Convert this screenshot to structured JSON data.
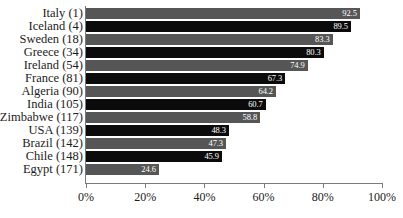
{
  "chart_data": {
    "type": "bar",
    "orientation": "horizontal",
    "title": "",
    "subtitle": "",
    "xlabel": "",
    "ylabel": "",
    "xlim": [
      0,
      100
    ],
    "grid": false,
    "legend": null,
    "x_tick_labels": [
      "0%",
      "20%",
      "40%",
      "60%",
      "80%",
      "100%"
    ],
    "x_tick_values": [
      0,
      20,
      40,
      60,
      80,
      100
    ],
    "value_label_format": "one-decimal",
    "categories": [
      "Italy (1)",
      "Iceland (4)",
      "Sweden (18)",
      "Greece (34)",
      "Ireland (54)",
      "France (81)",
      "Algeria (90)",
      "India (105)",
      "Zimbabwe (117)",
      "USA (139)",
      "Brazil (142)",
      "Chile (148)",
      "Egypt (171)"
    ],
    "values": [
      92.5,
      89.5,
      83.3,
      80.3,
      74.9,
      67.3,
      64.2,
      60.7,
      58.8,
      48.3,
      47.3,
      45.9,
      24.6
    ],
    "value_labels": [
      "92.5",
      "89.5",
      "83.3",
      "80.3",
      "74.9",
      "67.3",
      "64.2",
      "60.7",
      "58.8",
      "48.3",
      "47.3",
      "45.9",
      "24.6"
    ],
    "bar_colors": [
      "#565656",
      "#0b0b0b",
      "#565656",
      "#0b0b0b",
      "#565656",
      "#0b0b0b",
      "#565656",
      "#0b0b0b",
      "#565656",
      "#0b0b0b",
      "#565656",
      "#0b0b0b",
      "#565656"
    ],
    "value_label_color": "#ffffff",
    "axis_color": "#7a7a7a",
    "background_color": "#ffffff",
    "rows": [
      {
        "label": "Italy (1)",
        "value": 92.5,
        "value_label": "92.5",
        "shade": "gray"
      },
      {
        "label": "Iceland (4)",
        "value": 89.5,
        "value_label": "89.5",
        "shade": "black"
      },
      {
        "label": "Sweden (18)",
        "value": 83.3,
        "value_label": "83.3",
        "shade": "gray"
      },
      {
        "label": "Greece (34)",
        "value": 80.3,
        "value_label": "80.3",
        "shade": "black"
      },
      {
        "label": "Ireland (54)",
        "value": 74.9,
        "value_label": "74.9",
        "shade": "gray"
      },
      {
        "label": "France (81)",
        "value": 67.3,
        "value_label": "67.3",
        "shade": "black"
      },
      {
        "label": "Algeria (90)",
        "value": 64.2,
        "value_label": "64.2",
        "shade": "gray"
      },
      {
        "label": "India (105)",
        "value": 60.7,
        "value_label": "60.7",
        "shade": "black"
      },
      {
        "label": "Zimbabwe (117)",
        "value": 58.8,
        "value_label": "58.8",
        "shade": "gray"
      },
      {
        "label": "USA (139)",
        "value": 48.3,
        "value_label": "48.3",
        "shade": "black"
      },
      {
        "label": "Brazil (142)",
        "value": 47.3,
        "value_label": "47.3",
        "shade": "gray"
      },
      {
        "label": "Chile (148)",
        "value": 45.9,
        "value_label": "45.9",
        "shade": "black"
      },
      {
        "label": "Egypt (171)",
        "value": 24.6,
        "value_label": "24.6",
        "shade": "gray"
      }
    ]
  }
}
